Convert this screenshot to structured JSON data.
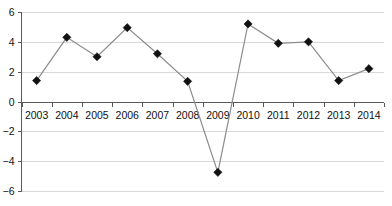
{
  "chart_data": {
    "type": "line",
    "title": "",
    "subtitle": "",
    "xlabel": "",
    "ylabel": "",
    "categories": [
      "2003",
      "2004",
      "2005",
      "2006",
      "2007",
      "2008",
      "2009",
      "2010",
      "2011",
      "2012",
      "2013",
      "2014"
    ],
    "values": [
      1.4,
      4.3,
      3.0,
      4.95,
      3.2,
      1.35,
      -4.75,
      5.2,
      3.9,
      4.0,
      1.4,
      2.2
    ],
    "series": [
      {
        "name": "",
        "values": [
          1.4,
          4.3,
          3.0,
          4.95,
          3.2,
          1.35,
          -4.75,
          5.2,
          3.9,
          4.0,
          1.4,
          2.2
        ]
      }
    ],
    "ylim": [
      -6,
      6
    ],
    "yticks": [
      6,
      4,
      2,
      0,
      -2,
      -4,
      -6
    ],
    "ytick_labels": [
      "6",
      "4",
      "2",
      "0",
      "−2",
      "−4",
      "−6"
    ],
    "grid": true,
    "grid_axis": "y",
    "legend": "none",
    "marker": "diamond",
    "colors": {
      "line": "#8c8c8c",
      "marker": "#111111",
      "grid": "#d9d9d9",
      "axis": "#595959",
      "background": "#ffffff",
      "text": "#111111"
    }
  }
}
